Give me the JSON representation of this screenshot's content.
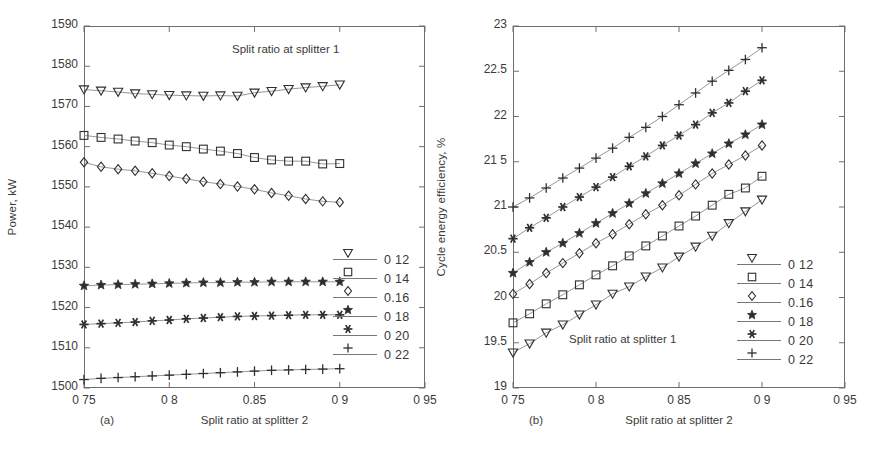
{
  "figure": {
    "panels": [
      {
        "id": "a",
        "panel_label": "(a)",
        "annotation": "Split ratio at splitter 1",
        "ylabel": "Power, kW",
        "xlabel": "Split ratio at splitter 2",
        "yticks": [
          "1500",
          "1510",
          "1520",
          "1530",
          "1540",
          "1550",
          "1560",
          "1570",
          "1580",
          "1590"
        ],
        "xticks": [
          "0 75",
          "0 8",
          "0.85",
          "0 9",
          "0 95"
        ]
      },
      {
        "id": "b",
        "panel_label": "(b)",
        "annotation": "Split ratio at splitter 1",
        "ylabel": "Cycle energy efficiency, %",
        "xlabel": "Split ratio at splitter 2",
        "yticks": [
          "19",
          "19.5",
          "20",
          "20.5",
          "21",
          "21 5",
          "22",
          "22.5",
          "23"
        ],
        "xticks": [
          "0 75",
          "0 8",
          "0 85",
          "0 9",
          "0 95"
        ]
      }
    ],
    "legend_labels": [
      "0 12",
      "0 14",
      "0.16",
      "0 18",
      "0 20",
      "0 22"
    ],
    "legend_markers": [
      "triangle-down",
      "square",
      "diamond",
      "star",
      "asterisk",
      "plus"
    ]
  },
  "chart_data": [
    {
      "type": "line",
      "panel": "a",
      "title": "",
      "annotation": "Split ratio at splitter 1",
      "xlabel": "Split ratio at splitter 2",
      "ylabel": "Power, kW",
      "xlim": [
        0.75,
        0.95
      ],
      "ylim": [
        1500,
        1590
      ],
      "xticks": [
        0.75,
        0.8,
        0.85,
        0.9,
        0.95
      ],
      "yticks": [
        1500,
        1510,
        1520,
        1530,
        1540,
        1550,
        1560,
        1570,
        1580,
        1590
      ],
      "grid": false,
      "legend_position": "right-outside",
      "x": [
        0.75,
        0.76,
        0.77,
        0.78,
        0.79,
        0.8,
        0.81,
        0.82,
        0.83,
        0.84,
        0.85,
        0.86,
        0.87,
        0.88,
        0.89,
        0.9
      ],
      "series": [
        {
          "name": "0 12",
          "marker": "triangle-down",
          "values": [
            1574.2,
            1573.9,
            1573.6,
            1573.2,
            1573.0,
            1572.8,
            1572.7,
            1572.6,
            1572.7,
            1572.6,
            1573.4,
            1573.8,
            1574.3,
            1574.7,
            1575.0,
            1575.4
          ]
        },
        {
          "name": "0 14",
          "marker": "square",
          "values": [
            1562.8,
            1562.3,
            1561.9,
            1561.4,
            1561.0,
            1560.4,
            1560.0,
            1559.4,
            1558.9,
            1558.3,
            1557.3,
            1556.7,
            1556.4,
            1556.4,
            1555.7,
            1555.8
          ]
        },
        {
          "name": "0.16",
          "marker": "diamond",
          "values": [
            1556.1,
            1555.0,
            1554.4,
            1554.0,
            1553.4,
            1552.7,
            1552.0,
            1551.3,
            1550.7,
            1550.1,
            1549.4,
            1548.5,
            1547.8,
            1547.0,
            1546.4,
            1546.2
          ]
        },
        {
          "name": "0 18",
          "marker": "star",
          "values": [
            1525.4,
            1525.6,
            1525.7,
            1525.8,
            1525.9,
            1526.0,
            1526.1,
            1526.2,
            1526.2,
            1526.3,
            1526.3,
            1526.4,
            1526.4,
            1526.4,
            1526.4,
            1526.4
          ]
        },
        {
          "name": "0 20",
          "marker": "asterisk",
          "values": [
            1515.8,
            1516.0,
            1516.2,
            1516.4,
            1516.7,
            1516.9,
            1517.2,
            1517.4,
            1517.6,
            1517.8,
            1517.9,
            1518.0,
            1518.1,
            1518.2,
            1518.2,
            1518.2
          ]
        },
        {
          "name": "0 22",
          "marker": "plus",
          "values": [
            1502.1,
            1502.4,
            1502.6,
            1502.8,
            1503.0,
            1503.2,
            1503.4,
            1503.6,
            1503.8,
            1504.0,
            1504.2,
            1504.4,
            1504.5,
            1504.6,
            1504.7,
            1504.8
          ]
        }
      ]
    },
    {
      "type": "line",
      "panel": "b",
      "title": "",
      "annotation": "Split ratio at splitter 1",
      "xlabel": "Split ratio at splitter 2",
      "ylabel": "Cycle energy efficiency, %",
      "xlim": [
        0.75,
        0.95
      ],
      "ylim": [
        19,
        23
      ],
      "xticks": [
        0.75,
        0.8,
        0.85,
        0.9,
        0.95
      ],
      "yticks": [
        19,
        19.5,
        20,
        20.5,
        21,
        21.5,
        22,
        22.5,
        23
      ],
      "grid": false,
      "legend_position": "right-outside",
      "x": [
        0.75,
        0.76,
        0.77,
        0.78,
        0.79,
        0.8,
        0.81,
        0.82,
        0.83,
        0.84,
        0.85,
        0.86,
        0.87,
        0.88,
        0.89,
        0.9
      ],
      "series": [
        {
          "name": "0 12",
          "marker": "triangle-down",
          "values": [
            19.39,
            19.49,
            19.61,
            19.7,
            19.81,
            19.92,
            20.04,
            20.12,
            20.23,
            20.33,
            20.45,
            20.56,
            20.68,
            20.82,
            20.95,
            21.08
          ]
        },
        {
          "name": "0 14",
          "marker": "square",
          "values": [
            19.72,
            19.82,
            19.93,
            20.03,
            20.14,
            20.25,
            20.35,
            20.46,
            20.57,
            20.68,
            20.79,
            20.9,
            21.02,
            21.14,
            21.21,
            21.34
          ]
        },
        {
          "name": "0.16",
          "marker": "diamond",
          "values": [
            20.04,
            20.15,
            20.27,
            20.38,
            20.49,
            20.6,
            20.7,
            20.81,
            20.92,
            21.02,
            21.13,
            21.25,
            21.37,
            21.47,
            21.57,
            21.68
          ]
        },
        {
          "name": "0 18",
          "marker": "star",
          "values": [
            20.27,
            20.39,
            20.5,
            20.6,
            20.71,
            20.82,
            20.93,
            21.04,
            21.15,
            21.26,
            21.37,
            21.48,
            21.59,
            21.7,
            21.8,
            21.91
          ]
        },
        {
          "name": "0 20",
          "marker": "asterisk",
          "values": [
            20.65,
            20.77,
            20.88,
            21.0,
            21.11,
            21.22,
            21.33,
            21.45,
            21.56,
            21.68,
            21.79,
            21.91,
            22.04,
            22.15,
            22.28,
            22.4
          ]
        },
        {
          "name": "0 22",
          "marker": "plus",
          "values": [
            21.0,
            21.1,
            21.21,
            21.32,
            21.43,
            21.54,
            21.65,
            21.77,
            21.88,
            22.0,
            22.13,
            22.26,
            22.39,
            22.51,
            22.63,
            22.76
          ]
        }
      ]
    }
  ]
}
